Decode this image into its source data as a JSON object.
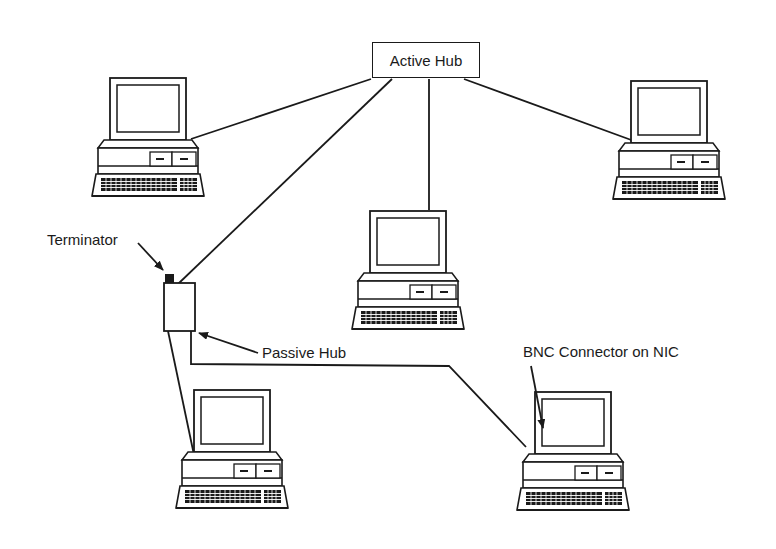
{
  "diagram": {
    "type": "network-topology",
    "nodes": {
      "active_hub": {
        "label": "Active Hub"
      },
      "passive_hub": {
        "label": "Passive Hub"
      },
      "terminator": {
        "label": "Terminator"
      },
      "computers": [
        {
          "id": "pc-top-left"
        },
        {
          "id": "pc-center"
        },
        {
          "id": "pc-top-right"
        },
        {
          "id": "pc-bottom-left"
        },
        {
          "id": "pc-bottom-right"
        }
      ]
    },
    "annotations": {
      "terminator": "Terminator",
      "passive_hub": "Passive Hub",
      "bnc": "BNC Connector on NIC"
    },
    "connections": [
      {
        "from": "active_hub",
        "to": "pc-top-left"
      },
      {
        "from": "active_hub",
        "to": "passive_hub"
      },
      {
        "from": "active_hub",
        "to": "pc-center"
      },
      {
        "from": "active_hub",
        "to": "pc-top-right"
      },
      {
        "from": "passive_hub",
        "to": "pc-bottom-left"
      },
      {
        "from": "passive_hub",
        "to": "pc-bottom-right"
      }
    ],
    "colors": {
      "line": "#1a1a1a",
      "background": "#ffffff"
    }
  }
}
